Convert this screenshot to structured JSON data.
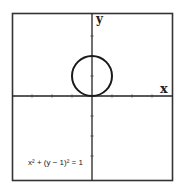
{
  "chart_data": {
    "type": "line",
    "title": "",
    "xlabel": "x",
    "ylabel": "y",
    "xlim": [
      -4,
      4
    ],
    "ylim": [
      -4.2,
      4.2
    ],
    "grid": false,
    "x_ticks": [
      -3,
      -2,
      -1,
      1,
      2,
      3
    ],
    "y_ticks": [
      -3,
      -2,
      -1,
      1,
      2,
      3
    ],
    "series": [
      {
        "name": "x² + (y − 1)² = 1",
        "kind": "circle",
        "center": [
          0,
          1
        ],
        "radius": 1
      }
    ],
    "annotations": [
      {
        "text": "x² + (y − 1)² = 1",
        "position": "bottom-left"
      }
    ]
  },
  "labels": {
    "x_axis": "x",
    "y_axis": "y",
    "equation": "x² + (y − 1)² = 1"
  }
}
